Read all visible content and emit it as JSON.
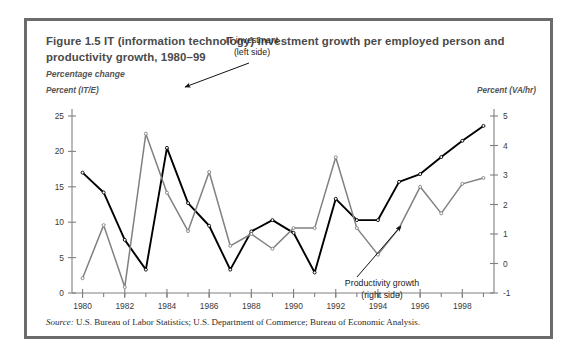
{
  "figure": {
    "title": "Figure 1.5  IT (information technology) investment growth per employed person and productivity growth, 1980–99",
    "subtitle": "Percentage change",
    "left_axis_label": "Percent (IT/E)",
    "right_axis_label": "Percent (VA/hr)",
    "source_word": "Source:",
    "source_text": " U.S. Bureau of Labor Statistics; U.S. Department of Commerce; Bureau of Economic Analysis."
  },
  "annotations": {
    "it_investment_line1": "IT investment",
    "it_investment_line2": "(left side)",
    "productivity_line1": "Productivity growth",
    "productivity_line2": "(right side)"
  },
  "colors": {
    "it_investment_line": "#000000",
    "productivity_line": "#808080",
    "frame_border": "#6b6b6b",
    "axis": "#808080",
    "title_text": "#4a4a4a",
    "background": "#ffffff"
  },
  "chart_data": {
    "type": "line",
    "title": "Figure 1.5  IT (information technology) investment growth per employed person and productivity growth, 1980–99",
    "subtitle": "Percentage change",
    "xlabel": "",
    "ylabel": "Percent (IT/E)",
    "y2label": "Percent (VA/hr)",
    "grid": false,
    "legend": "annotations",
    "x": [
      1980,
      1981,
      1982,
      1983,
      1984,
      1985,
      1986,
      1987,
      1988,
      1989,
      1990,
      1991,
      1992,
      1993,
      1994,
      1995,
      1996,
      1997,
      1998,
      1999
    ],
    "xtick_labels": [
      "1980",
      "1982",
      "1984",
      "1986",
      "1988",
      "1990",
      "1992",
      "1994",
      "1996",
      "1998"
    ],
    "xtick_values": [
      1980,
      1982,
      1984,
      1986,
      1988,
      1990,
      1992,
      1994,
      1996,
      1998
    ],
    "xlim": [
      1979.5,
      1999.5
    ],
    "ylim": [
      0,
      25
    ],
    "ytick_labels": [
      "0",
      "5",
      "10",
      "15",
      "20",
      "25"
    ],
    "ytick_values": [
      0,
      5,
      10,
      15,
      20,
      25
    ],
    "y2lim": [
      -1,
      5
    ],
    "y2tick_labels": [
      "-1",
      "0",
      "1",
      "2",
      "3",
      "4",
      "5"
    ],
    "y2tick_values": [
      -1,
      0,
      1,
      2,
      3,
      4,
      5
    ],
    "series": [
      {
        "name": "IT investment (left side)",
        "axis": "left",
        "color": "#000000",
        "values": [
          17.0,
          14.2,
          7.5,
          3.3,
          20.5,
          12.7,
          9.5,
          3.3,
          8.7,
          10.3,
          8.5,
          2.9,
          13.3,
          10.3,
          10.3,
          15.7,
          16.8,
          19.2,
          21.5,
          23.6
        ]
      },
      {
        "name": "Productivity growth (right side)",
        "axis": "right",
        "color": "#808080",
        "values": [
          -0.5,
          1.3,
          -0.8,
          4.4,
          2.4,
          1.1,
          3.1,
          0.6,
          1.0,
          0.5,
          1.2,
          1.2,
          3.6,
          1.2,
          0.3,
          1.2,
          2.6,
          1.7,
          2.7,
          2.9
        ]
      }
    ]
  }
}
